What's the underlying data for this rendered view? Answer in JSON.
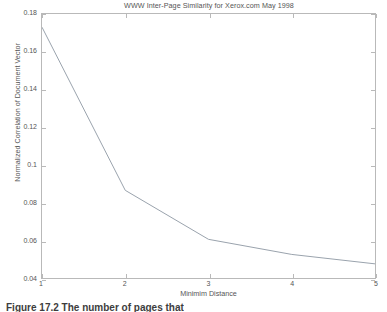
{
  "figure": {
    "background_color": "#ffffff",
    "axis_color": "#b9b9b9",
    "text_color": "#555555",
    "line_color": "#9aa3ad"
  },
  "caption": {
    "label": "Figure 17.2",
    "text": "The number of pages that"
  },
  "chart_data": {
    "type": "line",
    "title": "WWW Inter-Page Similarity for Xerox.com May 1998",
    "xlabel": "Minimim Distance",
    "ylabel": "Normalized Correlation of Document Vector",
    "x": [
      1,
      2,
      3,
      4,
      5
    ],
    "values": [
      0.173,
      0.0865,
      0.0605,
      0.0525,
      0.0475
    ],
    "series": [
      {
        "name": "Normalized Correlation of Document Vector",
        "values": [
          0.173,
          0.0865,
          0.0605,
          0.0525,
          0.0475
        ]
      }
    ],
    "xlim": [
      1,
      5
    ],
    "ylim": [
      0.04,
      0.18
    ],
    "xticks": [
      1,
      2,
      3,
      4,
      5
    ],
    "xtick_labels": [
      "1",
      "2",
      "3",
      "4",
      "5"
    ],
    "yticks": [
      0.04,
      0.06,
      0.08,
      0.1,
      0.12,
      0.14,
      0.16,
      0.18
    ],
    "ytick_labels": [
      "0.04",
      "0.06",
      "0.08",
      "0.1",
      "0.12",
      "0.14",
      "0.16",
      "0.18"
    ],
    "grid": false,
    "legend": null,
    "legend_position": "none",
    "marker": "none",
    "line_width": 1
  }
}
